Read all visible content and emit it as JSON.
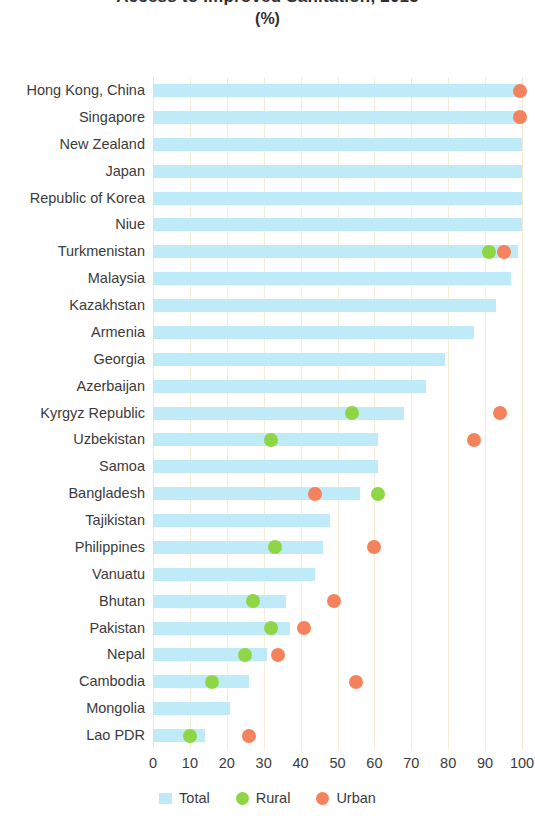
{
  "chart_data": {
    "type": "bar",
    "title": "Access to Improved Sanitation, 2015",
    "subtitle": "(%)",
    "xlabel": "",
    "ylabel": "",
    "xlim": [
      0,
      100
    ],
    "xticks": [
      0,
      10,
      20,
      30,
      40,
      50,
      60,
      70,
      80,
      90,
      100
    ],
    "grid": true,
    "orientation": "horizontal",
    "legend_position": "bottom",
    "colors": {
      "total": "#bfeaf7",
      "rural": "#8ed646",
      "urban": "#f4825c",
      "gridline": "#f3edd6",
      "text": "#3b3b3b"
    },
    "legend": [
      {
        "label": "Total",
        "marker": "square",
        "color": "#bfeaf7"
      },
      {
        "label": "Rural",
        "marker": "circle",
        "color": "#8ed646"
      },
      {
        "label": "Urban",
        "marker": "circle",
        "color": "#f4825c"
      }
    ],
    "categories": [
      "Hong Kong, China",
      "Singapore",
      "New Zealand",
      "Japan",
      "Republic of Korea",
      "Niue",
      "Turkmenistan",
      "Malaysia",
      "Kazakhstan",
      "Armenia",
      "Georgia",
      "Azerbaijan",
      "Kyrgyz Republic",
      "Uzbekistan",
      "Samoa",
      "Bangladesh",
      "Tajikistan",
      "Philippines",
      "Vanuatu",
      "Bhutan",
      "Pakistan",
      "Nepal",
      "Cambodia",
      "Mongolia",
      "Lao PDR"
    ],
    "series": [
      {
        "name": "Total",
        "values": [
          100,
          100,
          100,
          100,
          100,
          100,
          99,
          97,
          93,
          87,
          79,
          74,
          68,
          61,
          61,
          56,
          48,
          46,
          44,
          36,
          37,
          31,
          26,
          21,
          14
        ]
      },
      {
        "name": "Rural",
        "values": [
          null,
          null,
          null,
          null,
          null,
          null,
          91,
          null,
          null,
          null,
          null,
          null,
          54,
          32,
          null,
          61,
          null,
          33,
          null,
          27,
          32,
          25,
          16,
          null,
          10
        ]
      },
      {
        "name": "Urban",
        "values": [
          99.5,
          99.5,
          null,
          null,
          null,
          null,
          95,
          null,
          null,
          null,
          null,
          null,
          94,
          87,
          null,
          44,
          null,
          60,
          null,
          49,
          41,
          34,
          55,
          null,
          26
        ]
      }
    ]
  }
}
